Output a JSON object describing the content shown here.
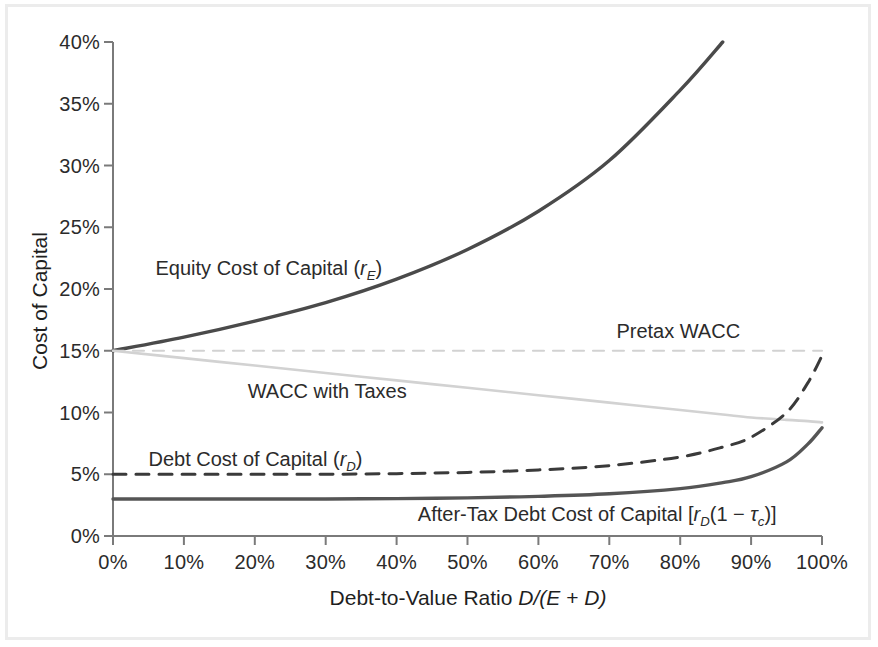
{
  "chart_data": {
    "type": "line",
    "title": "",
    "xlabel": "Debt-to-Value Ratio D/(E + D)",
    "ylabel": "Cost of Capital",
    "xlim": [
      0,
      100
    ],
    "ylim": [
      0,
      40
    ],
    "grid": false,
    "legend_position": "inline-annotations",
    "x_tick_labels": [
      "0%",
      "10%",
      "20%",
      "30%",
      "40%",
      "50%",
      "60%",
      "70%",
      "80%",
      "90%",
      "100%"
    ],
    "x_tick_values": [
      0,
      10,
      20,
      30,
      40,
      50,
      60,
      70,
      80,
      90,
      100
    ],
    "y_tick_labels": [
      "0%",
      "5%",
      "10%",
      "15%",
      "20%",
      "25%",
      "30%",
      "35%",
      "40%"
    ],
    "y_tick_values": [
      0,
      5,
      10,
      15,
      20,
      25,
      30,
      35,
      40
    ],
    "x": [
      0,
      10,
      20,
      30,
      40,
      50,
      60,
      70,
      80,
      86,
      90,
      95,
      98,
      100
    ],
    "series": [
      {
        "name": "Equity Cost of Capital (rE)",
        "style": "solid",
        "color": "#4a4a4a",
        "width": 3.4,
        "values": [
          15.0,
          16.1,
          17.4,
          18.9,
          20.8,
          23.2,
          26.3,
          30.4,
          36.1,
          40.0,
          null,
          null,
          null,
          null
        ]
      },
      {
        "name": "Pretax WACC",
        "style": "dashed",
        "color": "#d2d2d2",
        "width": 2.2,
        "values": [
          15.0,
          15.0,
          15.0,
          15.0,
          15.0,
          15.0,
          15.0,
          15.0,
          15.0,
          15.0,
          15.0,
          15.0,
          15.0,
          15.0
        ]
      },
      {
        "name": "WACC with Taxes",
        "style": "solid",
        "color": "#d2d2d2",
        "width": 2.6,
        "values": [
          15.0,
          14.4,
          13.8,
          13.2,
          12.6,
          12.0,
          11.4,
          10.8,
          10.2,
          9.84,
          9.6,
          9.4,
          9.3,
          9.2
        ]
      },
      {
        "name": "Debt Cost of Capital (rD)",
        "style": "dashed",
        "color": "#3a3a3a",
        "width": 3.0,
        "values": [
          5.0,
          5.0,
          5.0,
          5.0,
          5.05,
          5.15,
          5.35,
          5.7,
          6.4,
          7.2,
          8.0,
          10.0,
          12.4,
          14.6
        ]
      },
      {
        "name": "After-Tax Debt Cost of Capital [rD(1 - tc)]",
        "style": "solid",
        "color": "#555555",
        "width": 3.4,
        "values": [
          3.0,
          3.0,
          3.0,
          3.0,
          3.03,
          3.09,
          3.21,
          3.42,
          3.84,
          4.32,
          4.8,
          6.0,
          7.44,
          8.76
        ]
      }
    ],
    "annotations": [
      {
        "key": "equity",
        "text": "Equity Cost of Capital (rE)",
        "x": 6,
        "y": 21.5
      },
      {
        "key": "pretax_wacc",
        "text": "Pretax WACC",
        "x": 71,
        "y": 16.4
      },
      {
        "key": "wacc_taxes",
        "text": "WACC with Taxes",
        "x": 19,
        "y": 11.6
      },
      {
        "key": "debt",
        "text": "Debt Cost of Capital (rD)",
        "x": 5,
        "y": 6.1
      },
      {
        "key": "after_tax_debt",
        "text": "After-Tax Debt Cost of Capital [rD(1 - tc)]",
        "x": 43,
        "y": 1.6
      }
    ]
  },
  "axes": {
    "y_title": "Cost of Capital",
    "x_title_plain": "Debt-to-Value Ratio",
    "x_title_math_1": "D",
    "x_title_slash": "/(",
    "x_title_math_2": "E",
    "x_title_plus": " + ",
    "x_title_math_3": "D",
    "x_title_close": ")",
    "y_ticks": [
      "40%",
      "35%",
      "30%",
      "25%",
      "20%",
      "15%",
      "10%",
      "5%",
      "0%"
    ],
    "x_ticks": [
      "0%",
      "10%",
      "20%",
      "30%",
      "40%",
      "50%",
      "60%",
      "70%",
      "80%",
      "90%",
      "100%"
    ]
  },
  "labels": {
    "equity_main": "Equity Cost of Capital (",
    "equity_var": "r",
    "equity_sub": "E",
    "equity_close": ")",
    "pretax_wacc": "Pretax WACC",
    "wacc_with_taxes": "WACC with Taxes",
    "debt_main": "Debt Cost of Capital (",
    "debt_var": "r",
    "debt_sub": "D",
    "debt_close": ")",
    "aftertax_main": "After-Tax Debt Cost of Capital [",
    "aftertax_var": "r",
    "aftertax_sub": "D",
    "aftertax_paren": "(1 ",
    "aftertax_minus": "−",
    "aftertax_tau": " τ",
    "aftertax_tau_sub": "c",
    "aftertax_close": ")]"
  },
  "colors": {
    "equity_line": "#4a4a4a",
    "debt_line": "#3a3a3a",
    "aftertax_line": "#555555",
    "wacc_line": "#d2d2d2",
    "pretax_wacc_line": "#d2d2d2",
    "axis": "#7a7a7a",
    "frame": "#ececec",
    "text": "#2b2b2b"
  }
}
